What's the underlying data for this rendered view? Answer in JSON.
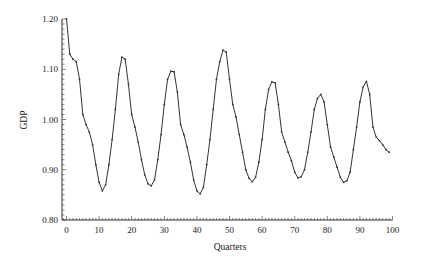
{
  "chart_data": {
    "type": "line",
    "title": "",
    "xlabel": "Quarters",
    "ylabel": "GDP",
    "xlim": [
      -1,
      100
    ],
    "ylim": [
      0.8,
      1.2
    ],
    "x_ticks": [
      0,
      10,
      20,
      30,
      40,
      50,
      60,
      70,
      80,
      90,
      100
    ],
    "y_ticks": [
      "0.80",
      "0.90",
      "1.00",
      "1.10",
      "1.20"
    ],
    "grid": false,
    "legend": null,
    "markers": "small dots at each quarter",
    "series": [
      {
        "name": "GDP",
        "x": [
          0,
          1,
          2,
          3,
          4,
          5,
          6,
          7,
          8,
          9,
          10,
          11,
          12,
          13,
          14,
          15,
          16,
          17,
          18,
          19,
          20,
          21,
          22,
          23,
          24,
          25,
          26,
          27,
          28,
          29,
          30,
          31,
          32,
          33,
          34,
          35,
          36,
          37,
          38,
          39,
          40,
          41,
          42,
          43,
          44,
          45,
          46,
          47,
          48,
          49,
          50,
          51,
          52,
          53,
          54,
          55,
          56,
          57,
          58,
          59,
          60,
          61,
          62,
          63,
          64,
          65,
          66,
          67,
          68,
          69,
          70,
          71,
          72,
          73,
          74,
          75,
          76,
          77,
          78,
          79,
          80,
          81,
          82,
          83,
          84,
          85,
          86,
          87,
          88,
          89,
          90,
          91,
          92,
          93,
          94,
          95,
          96,
          97,
          98,
          99
        ],
        "values": [
          1.2,
          1.13,
          1.12,
          1.115,
          1.08,
          1.01,
          0.99,
          0.975,
          0.95,
          0.91,
          0.875,
          0.858,
          0.87,
          0.91,
          0.96,
          1.02,
          1.09,
          1.124,
          1.12,
          1.07,
          1.01,
          0.985,
          0.955,
          0.92,
          0.89,
          0.872,
          0.868,
          0.88,
          0.92,
          0.97,
          1.03,
          1.08,
          1.096,
          1.095,
          1.055,
          0.99,
          0.97,
          0.945,
          0.915,
          0.88,
          0.858,
          0.852,
          0.865,
          0.91,
          0.96,
          1.02,
          1.08,
          1.115,
          1.138,
          1.134,
          1.08,
          1.03,
          1.005,
          0.97,
          0.935,
          0.9,
          0.883,
          0.876,
          0.885,
          0.915,
          0.96,
          1.02,
          1.06,
          1.075,
          1.073,
          1.03,
          0.975,
          0.955,
          0.935,
          0.918,
          0.895,
          0.884,
          0.886,
          0.9,
          0.935,
          0.975,
          1.02,
          1.042,
          1.05,
          1.035,
          0.99,
          0.945,
          0.925,
          0.905,
          0.885,
          0.875,
          0.878,
          0.895,
          0.94,
          0.985,
          1.035,
          1.065,
          1.076,
          1.05,
          0.985,
          0.965,
          0.958,
          0.95,
          0.94,
          0.935
        ]
      }
    ]
  },
  "colors": {
    "line": "#333333",
    "axis": "#333333",
    "background": "#ffffff"
  }
}
